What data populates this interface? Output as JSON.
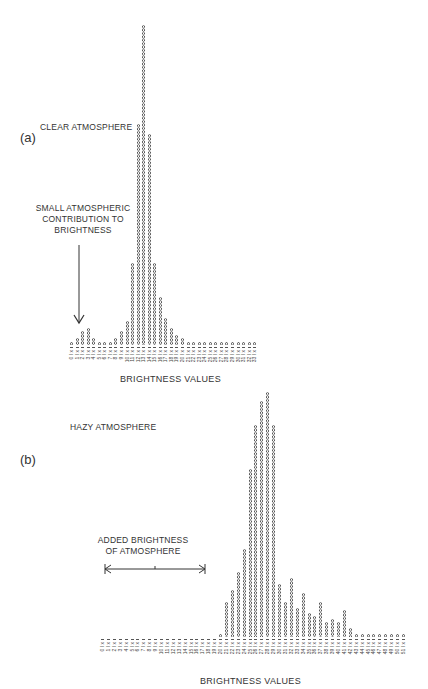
{
  "chart_data": [
    {
      "type": "bar",
      "panel": "(a)",
      "title": "CLEAR ATMOSPHERE",
      "annotation": "SMALL ATMOSPHERIC CONTRIBUTION TO BRIGHTNESS",
      "xlabel": "BRIGHTNESS VALUES",
      "ylabel": "",
      "categories": [
        0,
        1,
        2,
        3,
        4,
        5,
        6,
        7,
        8,
        9,
        10,
        11,
        12,
        13,
        14,
        15,
        16,
        17,
        18,
        19,
        20,
        21,
        22,
        23,
        24,
        25,
        26,
        27,
        28,
        29,
        30,
        31,
        32,
        33
      ],
      "values": [
        1,
        2,
        4,
        5,
        2,
        1,
        1,
        1,
        2,
        4,
        7,
        24,
        65,
        94,
        62,
        24,
        14,
        8,
        5,
        3,
        2,
        1,
        1,
        1,
        1,
        1,
        1,
        1,
        1,
        1,
        1,
        1,
        1,
        1
      ],
      "grid": false,
      "legend": "none"
    },
    {
      "type": "bar",
      "panel": "(b)",
      "title": "HAZY ATMOSPHERE",
      "annotation": "ADDED BRIGHTNESS OF ATMOSPHERE",
      "xlabel": "BRIGHTNESS VALUES",
      "ylabel": "",
      "categories": [
        0,
        1,
        2,
        3,
        4,
        5,
        6,
        7,
        8,
        9,
        10,
        11,
        12,
        13,
        14,
        15,
        16,
        17,
        18,
        19,
        20,
        21,
        22,
        23,
        24,
        25,
        26,
        27,
        28,
        29,
        30,
        31,
        32,
        33,
        34,
        35,
        36,
        37,
        38,
        39,
        40,
        41,
        42,
        43,
        44,
        45,
        46,
        47,
        48,
        49,
        50,
        51
      ],
      "values": [
        0,
        0,
        0,
        0,
        0,
        0,
        0,
        0,
        0,
        0,
        0,
        0,
        0,
        0,
        0,
        0,
        0,
        0,
        0,
        0,
        1,
        12,
        16,
        22,
        30,
        57,
        72,
        80,
        83,
        72,
        18,
        12,
        20,
        10,
        15,
        8,
        7,
        12,
        5,
        6,
        5,
        9,
        3,
        1,
        1,
        1,
        1,
        1,
        1,
        1,
        1,
        1
      ],
      "grid": false,
      "legend": "none"
    }
  ],
  "panel_a": {
    "label": "(a)",
    "title": "CLEAR ATMOSPHERE",
    "annotation_lines": [
      "SMALL ATMOSPHERIC",
      "CONTRIBUTION TO",
      "BRIGHTNESS"
    ],
    "xlabel": "BRIGHTNESS VALUES"
  },
  "panel_b": {
    "label": "(b)",
    "title": "HAZY ATMOSPHERE",
    "annotation_lines": [
      "ADDED BRIGHTNESS",
      "OF ATMOSPHERE"
    ],
    "xlabel": "BRIGHTNESS VALUES"
  }
}
